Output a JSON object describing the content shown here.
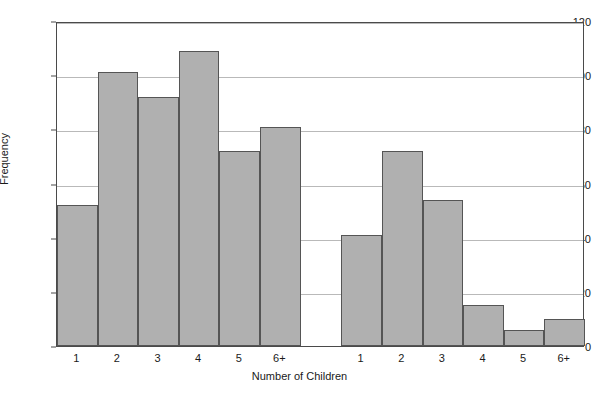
{
  "chart_data": {
    "type": "bar",
    "title": "",
    "xlabel": "Number of Children",
    "ylabel": "Frequency",
    "ylim": [
      0,
      120
    ],
    "ytick_step": 20,
    "yticks": [
      0,
      20,
      40,
      60,
      80,
      100,
      120
    ],
    "grid": true,
    "legend": "none",
    "categories": [
      "1",
      "2",
      "3",
      "4",
      "5",
      "6+"
    ],
    "annotations": [
      {
        "text": "Latter-day Saint",
        "group": "latter_day_saint"
      },
      {
        "text": "Non Latter-day Saint",
        "group": "non_latter_day_saint"
      }
    ],
    "series": [
      {
        "name": "Latter-day Saint",
        "categories": [
          "1",
          "2",
          "3",
          "4",
          "5",
          "6+"
        ],
        "values": [
          52,
          101,
          92,
          109,
          72,
          81
        ]
      },
      {
        "name": "Non Latter-day Saint",
        "categories": [
          "1",
          "2",
          "3",
          "4",
          "5",
          "6+"
        ],
        "values": [
          41,
          72,
          54,
          15,
          6,
          10
        ]
      }
    ],
    "colors": {
      "bar_fill": "#b0b0b0",
      "bar_stroke": "#555555",
      "gridline": "#b9b9b9",
      "axis": "#4a4a4a",
      "text": "#1a1a1a",
      "background": "#ffffff"
    }
  }
}
